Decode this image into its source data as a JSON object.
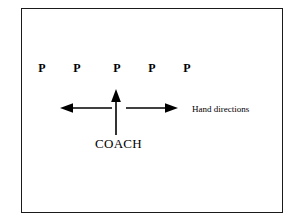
{
  "diagram": {
    "background_color": "#ffffff",
    "frame": {
      "name": "diagram-border",
      "stroke_color": "#1a1a1a",
      "fill_color": "#ffffff"
    },
    "players": {
      "label": "P",
      "count": 5,
      "color": "#000000",
      "markers": [
        {
          "label": "P",
          "x": 35
        },
        {
          "label": "P",
          "x": 70
        },
        {
          "label": "P",
          "x": 110
        },
        {
          "label": "P",
          "x": 145
        },
        {
          "label": "P",
          "x": 180
        }
      ]
    },
    "arrows": [
      {
        "name": "arrow-left",
        "direction": "left",
        "color": "#000000"
      },
      {
        "name": "arrow-up",
        "direction": "up",
        "color": "#000000"
      },
      {
        "name": "arrow-right",
        "direction": "right",
        "color": "#000000"
      }
    ],
    "coach_label": "COACH",
    "annotation_label": "Hand directions"
  }
}
